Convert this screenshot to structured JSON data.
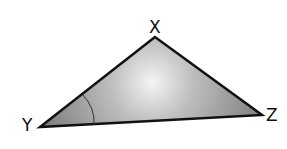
{
  "diagram": {
    "type": "triangle",
    "vertices": [
      {
        "label": "X",
        "x": 155,
        "y": 37
      },
      {
        "label": "Y",
        "x": 40,
        "y": 127
      },
      {
        "label": "Z",
        "x": 262,
        "y": 115
      }
    ],
    "marked_angle": "Y",
    "colors": {
      "fill_light": "#e8e8e8",
      "fill_dark": "#8a8a8a",
      "stroke": "#111111"
    }
  },
  "labels": {
    "x": "X",
    "y": "Y",
    "z": "Z"
  }
}
